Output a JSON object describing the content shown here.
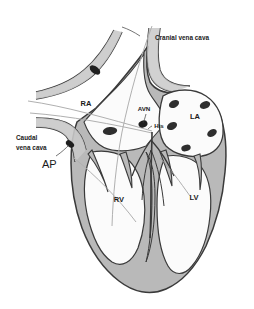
{
  "figure": {
    "background_color": "#ffffff",
    "width": 254,
    "height": 309
  },
  "palette": {
    "myocardium_fill": "#b9b9b9",
    "myocardium_fill_light": "#c9c9c9",
    "chamber_fill": "#fbfbfb",
    "outline": "#3a3a3a",
    "outline_dark": "#2b2b2b",
    "ostium_fill": "#2e2e2e",
    "marker_fill": "#1f1f1f",
    "conduction_line": "#b0b0b0",
    "label_color": "#1a1a1a"
  },
  "labels": {
    "cranial_vena_cava": "Cranial vena cava",
    "caudal_vena_cava_line1": "Caudal",
    "caudal_vena_cava_line2": "vena cava",
    "accessory_pathway": "AP",
    "right_atrium": "RA",
    "left_atrium": "LA",
    "right_ventricle": "RV",
    "left_ventricle": "LV",
    "av_node": "AVN",
    "his_bundle": "His"
  },
  "structures": {
    "chambers": [
      {
        "abbr": "RA",
        "name": "right-atrium"
      },
      {
        "abbr": "LA",
        "name": "left-atrium"
      },
      {
        "abbr": "RV",
        "name": "right-ventricle"
      },
      {
        "abbr": "LV",
        "name": "left-ventricle"
      }
    ],
    "vessels": [
      {
        "name": "cranial-vena-cava"
      },
      {
        "name": "caudal-vena-cava"
      }
    ],
    "conduction": [
      {
        "abbr": "AVN",
        "name": "atrioventricular-node"
      },
      {
        "abbr": "His",
        "name": "his-bundle"
      }
    ],
    "pulmonary_vein_ostia_count": 5,
    "accessory_pathway_markers_count": 2
  }
}
